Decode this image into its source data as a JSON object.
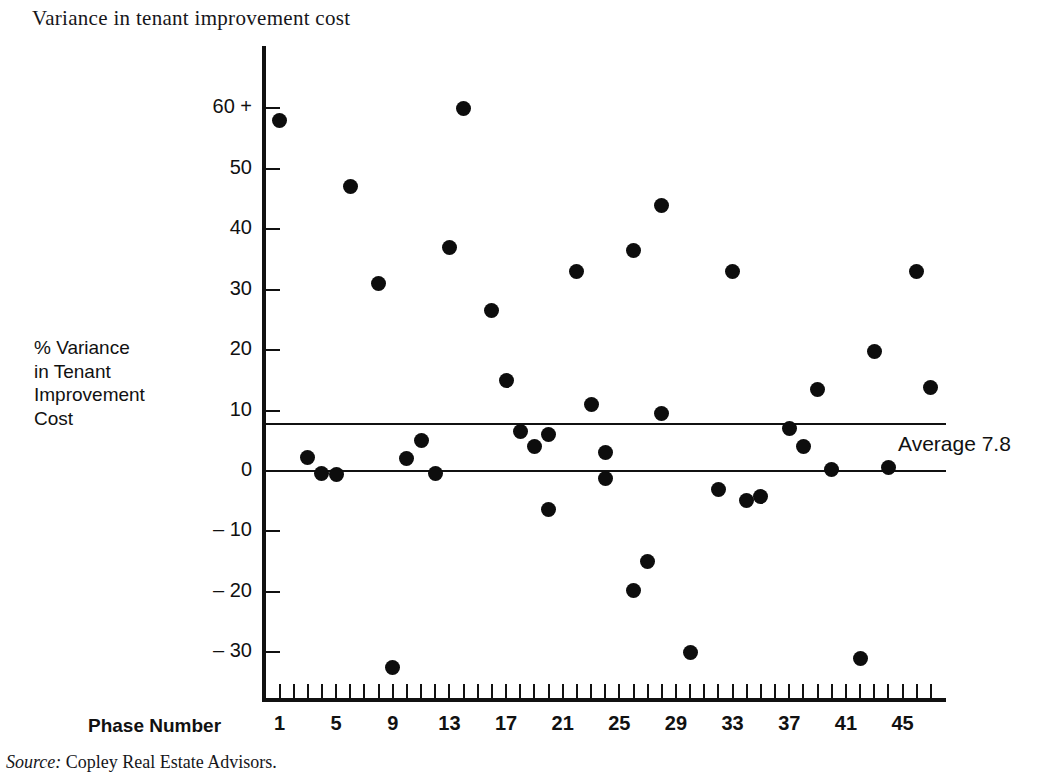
{
  "title": "Variance in tenant improvement cost",
  "source": {
    "label": "Source:",
    "text": " Copley Real Estate Advisors."
  },
  "y_axis": {
    "caption": "% Variance\nin Tenant\nImprovement\nCost",
    "tick_labels": [
      "60 +",
      "50",
      "40",
      "30",
      "20",
      "10",
      "0",
      "– 10",
      "– 20",
      "– 30"
    ],
    "tick_values": [
      60,
      50,
      40,
      30,
      20,
      10,
      0,
      -10,
      -20,
      -30
    ]
  },
  "x_axis": {
    "caption": "Phase Number",
    "tick_labels": [
      "1",
      "5",
      "9",
      "13",
      "17",
      "21",
      "25",
      "29",
      "33",
      "37",
      "41",
      "45"
    ],
    "tick_values": [
      1,
      5,
      9,
      13,
      17,
      21,
      25,
      29,
      33,
      37,
      41,
      45
    ]
  },
  "annotations": {
    "average_label": "Average 7.8"
  },
  "colors": {
    "marker": "#0d0d0d",
    "axis": "#111111",
    "background": "#ffffff"
  },
  "chart_data": {
    "type": "scatter",
    "title": "Variance in tenant improvement cost",
    "xlabel": "Phase Number",
    "ylabel": "% Variance in Tenant Improvement Cost",
    "xlim": [
      0,
      48
    ],
    "ylim": [
      -35,
      65
    ],
    "grid": false,
    "legend": null,
    "reference_lines": [
      {
        "name": "average",
        "orientation": "horizontal",
        "value": 7.8,
        "label": "Average 7.8"
      },
      {
        "name": "zero",
        "orientation": "horizontal",
        "value": 0,
        "label": ""
      }
    ],
    "x": [
      1,
      3,
      4,
      5,
      6,
      8,
      9,
      10,
      11,
      12,
      13,
      14,
      16,
      17,
      18,
      19,
      20,
      20,
      21,
      22,
      23,
      24,
      25,
      25,
      26,
      26,
      27,
      28,
      29,
      30,
      32,
      33,
      34,
      35,
      36,
      37,
      38,
      39,
      41,
      42,
      43,
      44,
      46,
      47
    ],
    "y": [
      58,
      2.3,
      -0.4,
      -0.5,
      47,
      31,
      -32.5,
      2,
      5,
      -0.4,
      37,
      60,
      26.5,
      15,
      6.5,
      4,
      6,
      5.8,
      -6.3,
      33,
      11,
      3,
      -1.2,
      -19.8,
      36.5,
      -15,
      44,
      9.5,
      -30,
      -30,
      -3,
      33,
      -4.8,
      -4.3,
      7,
      4,
      13.5,
      0.2,
      -31,
      19.8,
      0.5,
      33,
      13.8,
      13.8
    ],
    "points": [
      {
        "phase": 1,
        "variance": 58
      },
      {
        "phase": 3,
        "variance": 2.3
      },
      {
        "phase": 4,
        "variance": -0.4
      },
      {
        "phase": 5,
        "variance": -0.5
      },
      {
        "phase": 6,
        "variance": 47
      },
      {
        "phase": 8,
        "variance": 31
      },
      {
        "phase": 9,
        "variance": -32.5
      },
      {
        "phase": 10,
        "variance": 2
      },
      {
        "phase": 11,
        "variance": 5
      },
      {
        "phase": 12,
        "variance": -0.4
      },
      {
        "phase": 13,
        "variance": 37
      },
      {
        "phase": 14,
        "variance": 60
      },
      {
        "phase": 16,
        "variance": 26.5
      },
      {
        "phase": 17,
        "variance": 15
      },
      {
        "phase": 18,
        "variance": 6.5
      },
      {
        "phase": 19,
        "variance": 4
      },
      {
        "phase": 20,
        "variance": 6
      },
      {
        "phase": 20,
        "variance": -6.3
      },
      {
        "phase": 22,
        "variance": 33
      },
      {
        "phase": 23,
        "variance": 11
      },
      {
        "phase": 24,
        "variance": 3
      },
      {
        "phase": 24,
        "variance": -1.2
      },
      {
        "phase": 26,
        "variance": -19.8
      },
      {
        "phase": 26,
        "variance": 36.5
      },
      {
        "phase": 27,
        "variance": -15
      },
      {
        "phase": 28,
        "variance": 44
      },
      {
        "phase": 28,
        "variance": 9.5
      },
      {
        "phase": 30,
        "variance": -30
      },
      {
        "phase": 32,
        "variance": -3
      },
      {
        "phase": 33,
        "variance": 33
      },
      {
        "phase": 34,
        "variance": -4.8
      },
      {
        "phase": 35,
        "variance": -4.3
      },
      {
        "phase": 37,
        "variance": 7
      },
      {
        "phase": 38,
        "variance": 4
      },
      {
        "phase": 39,
        "variance": 13.5
      },
      {
        "phase": 40,
        "variance": 0.2
      },
      {
        "phase": 42,
        "variance": -31
      },
      {
        "phase": 43,
        "variance": 19.8
      },
      {
        "phase": 44,
        "variance": 0.5
      },
      {
        "phase": 46,
        "variance": 33
      },
      {
        "phase": 47,
        "variance": 13.8
      }
    ]
  }
}
